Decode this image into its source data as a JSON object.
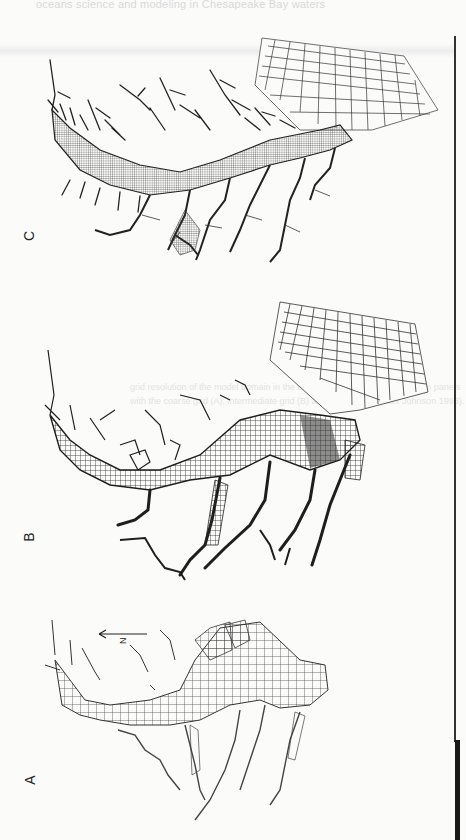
{
  "page": {
    "bleed_header": "oceans science and modeling in Chesapeake Bay waters",
    "bleed_captions": [
      "grid resolution of the model domain in the Bay and its tributaries is shown in panels",
      "with the coarse grid (A), intermediate grid (B) and fine grid (C) (after Johnson 1993)."
    ]
  },
  "figure": {
    "orientation": "rotated 90 degrees counter-clockwise",
    "panels": [
      {
        "label": "A",
        "description": "coarse grid",
        "has_north_arrow": true
      },
      {
        "label": "B",
        "description": "intermediate grid"
      },
      {
        "label": "C",
        "description": "fine grid"
      }
    ],
    "north_arrow": {
      "label": "N",
      "direction": "left"
    },
    "colors": {
      "line": "#2a2a2a",
      "paper": "#fbfbfa",
      "bleed": "#dedede"
    }
  }
}
